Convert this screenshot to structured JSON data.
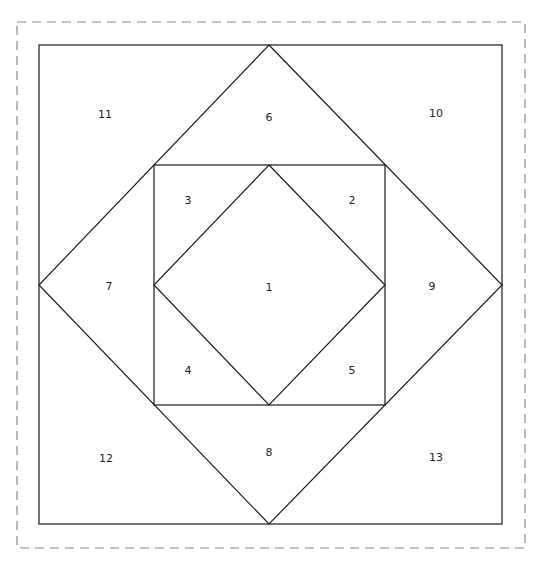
{
  "diagram": {
    "title": "",
    "pieces": [
      {
        "id": "1",
        "label": "1",
        "x": 269,
        "y": 288
      },
      {
        "id": "2",
        "label": "2",
        "x": 352,
        "y": 201
      },
      {
        "id": "3",
        "label": "3",
        "x": 188,
        "y": 201
      },
      {
        "id": "4",
        "label": "4",
        "x": 188,
        "y": 371
      },
      {
        "id": "5",
        "label": "5",
        "x": 352,
        "y": 371
      },
      {
        "id": "6",
        "label": "6",
        "x": 269,
        "y": 118
      },
      {
        "id": "7",
        "label": "7",
        "x": 109,
        "y": 287
      },
      {
        "id": "8",
        "label": "8",
        "x": 269,
        "y": 453
      },
      {
        "id": "9",
        "label": "9",
        "x": 432,
        "y": 287
      },
      {
        "id": "10",
        "label": "10",
        "x": 436,
        "y": 114
      },
      {
        "id": "11",
        "label": "11",
        "x": 105,
        "y": 115
      },
      {
        "id": "12",
        "label": "12",
        "x": 106,
        "y": 459
      },
      {
        "id": "13",
        "label": "13",
        "x": 436,
        "y": 458
      }
    ],
    "colors": {
      "line": "#1a1a1a",
      "dashed": "#888888",
      "background": "#ffffff"
    }
  }
}
